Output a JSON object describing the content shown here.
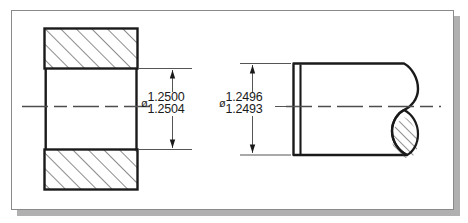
{
  "drawing": {
    "title": "Hole and shaft clearance fit detail",
    "sheet": {
      "border_color": "#8a8a8a",
      "shadow_color": "#b0b0b0",
      "background": "#ffffff"
    },
    "line_color": "#1a1a1a",
    "thin_line_color": "#555555",
    "centerline_color": "#4d4d4d",
    "views": [
      {
        "name": "hole-section-view",
        "description": "Sectioned plate with bore, full section with 45 degree hatching",
        "dimension": {
          "name": "hole-diameter",
          "symbol": "ø",
          "upper": "1.2500",
          "lower": "1.2504"
        }
      },
      {
        "name": "shaft-view",
        "description": "Cylindrical shaft with conventional S-break at right end",
        "dimension": {
          "name": "shaft-diameter",
          "symbol": "ø",
          "upper": "1.2496",
          "lower": "1.2493"
        }
      }
    ]
  },
  "labels": {
    "hole_dia_symbol": "ø",
    "hole_dia_upper": "1.2500",
    "hole_dia_lower": "1.2504",
    "shaft_dia_symbol": "ø",
    "shaft_dia_upper": "1.2496",
    "shaft_dia_lower": "1.2493"
  }
}
